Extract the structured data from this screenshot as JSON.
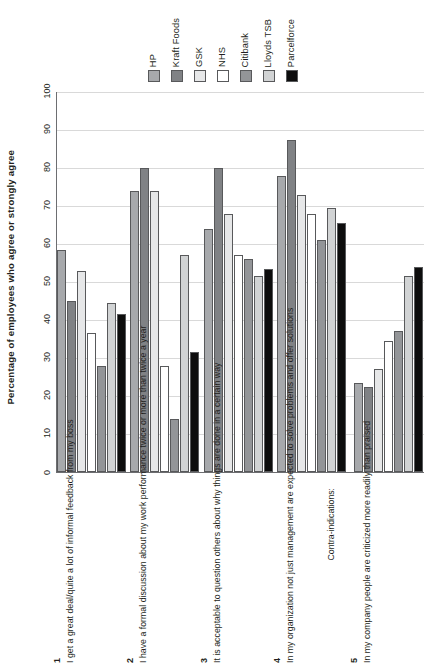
{
  "chart_data": {
    "type": "bar",
    "title": "",
    "ylabel": "Percentage of employees who agree or strongly agree",
    "xlabel": "",
    "ylim": [
      0,
      100
    ],
    "yticks": [
      0,
      10,
      20,
      30,
      40,
      50,
      60,
      70,
      80,
      90,
      100
    ],
    "grid": true,
    "legend_position": "top",
    "categories": [
      "I get a great deal/quite a lot of informal feedback from my boss",
      "I have a formal discussion about my work performance twice or more than twice a year",
      "It is acceptable to question others about why things are done in a certain way",
      "In my organization not just management are expected to solve problems and offer solutions",
      "In my company people are criticized more readily than praised"
    ],
    "category_numbers": [
      "1",
      "2",
      "3",
      "4",
      "5"
    ],
    "section_note": "Contra-indications:",
    "series": [
      {
        "name": "HP",
        "color": "#a7a9ac",
        "values": [
          58.5,
          74,
          64,
          78,
          23.5
        ]
      },
      {
        "name": "Kraft Foods",
        "color": "#808285",
        "values": [
          45,
          80,
          80,
          87.5,
          22.5
        ]
      },
      {
        "name": "GSK",
        "color": "#e6e7e8",
        "values": [
          53,
          74,
          68,
          73,
          27
        ]
      },
      {
        "name": "NHS",
        "color": "#ffffff",
        "values": [
          36.5,
          28,
          57,
          68,
          34.5
        ]
      },
      {
        "name": "Citibank",
        "color": "#939598",
        "values": [
          28,
          14,
          56,
          61,
          37
        ]
      },
      {
        "name": "Lloyds TSB",
        "color": "#d1d3d4",
        "values": [
          44.5,
          57,
          51.5,
          69.5,
          51.5
        ]
      },
      {
        "name": "Parcelforce",
        "color": "#0d0d0d",
        "values": [
          41.5,
          31.5,
          53.5,
          65.5,
          54
        ]
      }
    ]
  }
}
